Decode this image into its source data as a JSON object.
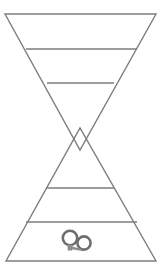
{
  "canvas": {
    "width": 164,
    "height": 279,
    "background_color": "#ffffff"
  },
  "figure": {
    "name": "hourglass-bowtie-diagram",
    "stroke_color": "#7d7d7d",
    "stroke_width": 1.4,
    "fill": "none"
  },
  "shapes": {
    "triangle_down": {
      "label": "downward-triangle",
      "points": "5,14 156,14 80,150",
      "apex": {
        "x": 80,
        "y": 150
      },
      "base_y": 14
    },
    "triangle_up": {
      "label": "upward-triangle",
      "points": "6,261 156,261 80,128",
      "apex": {
        "x": 80,
        "y": 128
      },
      "base_y": 261
    },
    "crossing_point": {
      "x": 80,
      "y": 138
    }
  },
  "crossbars": [
    {
      "label": "crossbar-1",
      "x1": 26,
      "y1": 49,
      "x2": 137,
      "y2": 49
    },
    {
      "label": "crossbar-2",
      "x1": 47,
      "y1": 83,
      "x2": 114,
      "y2": 83
    },
    {
      "label": "crossbar-3",
      "x1": 47,
      "y1": 188,
      "x2": 114,
      "y2": 188
    },
    {
      "label": "crossbar-4",
      "x1": 26,
      "y1": 222,
      "x2": 137,
      "y2": 222
    }
  ],
  "icon": {
    "name": "handcuffs-icon",
    "label": "handcuffs",
    "center": {
      "x": 76,
      "y": 242
    },
    "stroke_color": "#6e6e6e",
    "fill_color": "#8d8d8d",
    "ring_left": {
      "cx": 70,
      "cy": 238,
      "r": 7.2
    },
    "ring_right": {
      "cx": 84,
      "cy": 243,
      "r": 6.6
    }
  },
  "colors": {
    "line": "#7d7d7d",
    "icon_stroke": "#6e6e6e",
    "icon_fill": "#8d8d8d",
    "background": "#ffffff"
  }
}
